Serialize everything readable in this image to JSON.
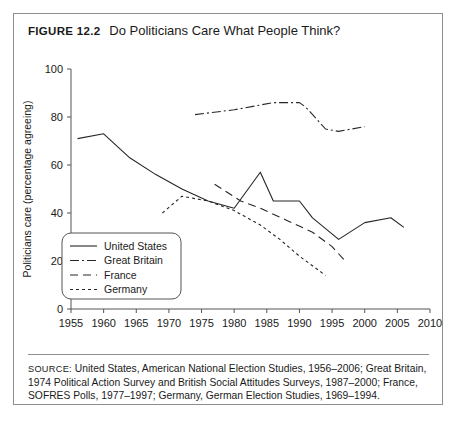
{
  "figure": {
    "label": "Figure 12.2",
    "label_prefix": "F",
    "label_rest": "IGURE",
    "number": "12.2",
    "title": "Do Politicians Care What People Think?"
  },
  "source": {
    "label": "Source:",
    "text": "United States, American National Election Studies, 1956–2006; Great Britain, 1974 Political Action Survey and British Social Attitudes Surveys, 1987–2000; France, SOFRES Polls, 1977–1997; Germany, German Election Studies, 1969–1994."
  },
  "legend": {
    "items": [
      {
        "label": "United States",
        "style": "solid",
        "dash": "none"
      },
      {
        "label": "Great Britain",
        "style": "dash-dot",
        "dash": "9,3,2,3"
      },
      {
        "label": "France",
        "style": "long-dash",
        "dash": "8,5"
      },
      {
        "label": "Germany",
        "style": "short-dash",
        "dash": "3,3"
      }
    ]
  },
  "chart_data": {
    "type": "line",
    "title": "Do Politicians Care What People Think?",
    "xlabel": "",
    "ylabel": "Politicians care (percentage agreeing)",
    "xlim": [
      1955,
      2010
    ],
    "ylim": [
      0,
      100
    ],
    "xticks": [
      1955,
      1960,
      1965,
      1970,
      1975,
      1980,
      1985,
      1990,
      1995,
      2000,
      2005,
      2010
    ],
    "yticks": [
      0,
      20,
      40,
      60,
      80,
      100
    ],
    "grid": false,
    "legend_position": "lower-left",
    "series": [
      {
        "name": "United States",
        "style": "solid",
        "dash": "none",
        "x": [
          1956,
          1960,
          1964,
          1968,
          1972,
          1976,
          1980,
          1984,
          1986,
          1990,
          1992,
          1996,
          2000,
          2004,
          2006
        ],
        "y": [
          71,
          73,
          63,
          56,
          50,
          45,
          42,
          57,
          45,
          45,
          38,
          29,
          36,
          38,
          34
        ]
      },
      {
        "name": "Great Britain",
        "style": "dash-dot",
        "dash": "9,3,2,3",
        "x": [
          1974,
          1980,
          1986,
          1990,
          1991,
          1994,
          1996,
          2000
        ],
        "y": [
          81,
          83,
          86,
          86,
          84,
          75,
          74,
          76
        ]
      },
      {
        "name": "France",
        "style": "long-dash",
        "dash": "8,5",
        "x": [
          1977,
          1981,
          1984,
          1988,
          1992,
          1995,
          1997
        ],
        "y": [
          52,
          45,
          42,
          37,
          32,
          26,
          20
        ]
      },
      {
        "name": "Germany",
        "style": "short-dash",
        "dash": "3,3",
        "x": [
          1969,
          1972,
          1976,
          1980,
          1984,
          1987,
          1990,
          1994
        ],
        "y": [
          40,
          47,
          45,
          41,
          35,
          29,
          22,
          14
        ]
      }
    ]
  }
}
